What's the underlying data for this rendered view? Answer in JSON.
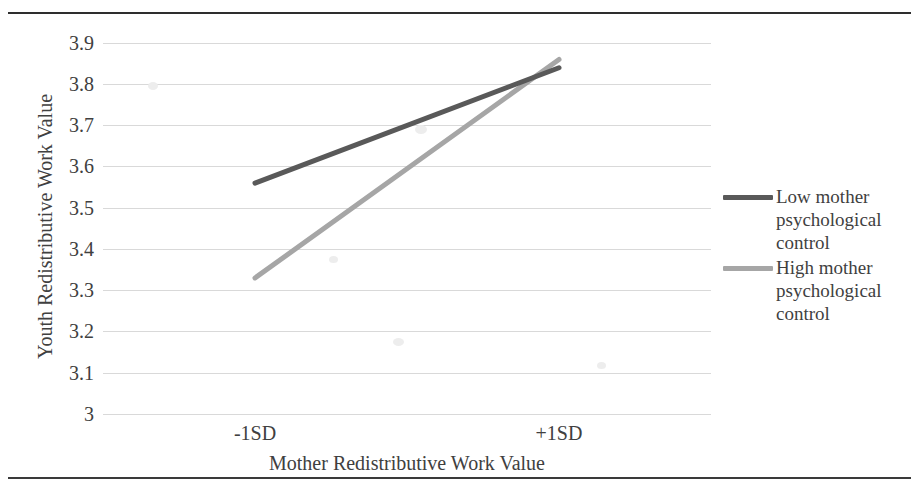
{
  "chart_data": {
    "type": "line",
    "title": "",
    "xlabel": "Mother Redistributive Work Value",
    "ylabel": "Youth Redistributive Work Value",
    "categories": [
      "-1SD",
      "+1SD"
    ],
    "x_tick_labels": [
      "-1SD",
      "+1SD"
    ],
    "y_tick_labels": [
      "3.9",
      "3.8",
      "3.7",
      "3.6",
      "3.5",
      "3.4",
      "3.3",
      "3.2",
      "3.1",
      "3"
    ],
    "y_tick_values": [
      3.9,
      3.8,
      3.7,
      3.6,
      3.5,
      3.4,
      3.3,
      3.2,
      3.1,
      3.0
    ],
    "ylim": [
      3.0,
      3.9
    ],
    "grid": "horizontal",
    "legend_position": "right",
    "series": [
      {
        "name": "Low mother psychological control",
        "label_lines": [
          "Low mother",
          "psychological",
          "control"
        ],
        "values": [
          3.56,
          3.84
        ],
        "color": "#595959"
      },
      {
        "name": "High mother psychological control",
        "label_lines": [
          "High mother",
          "psychological",
          "control"
        ],
        "values": [
          3.33,
          3.86
        ],
        "color": "#a6a6a6"
      }
    ]
  },
  "axes": {
    "y_title": "Youth Redistributive Work Value",
    "x_title": "Mother Redistributive Work Value",
    "y_ticks": [
      "3.9",
      "3.8",
      "3.7",
      "3.6",
      "3.5",
      "3.4",
      "3.3",
      "3.2",
      "3.1",
      "3"
    ],
    "x_ticks": [
      "-1SD",
      "+1SD"
    ]
  },
  "legend": {
    "entries": [
      {
        "line1": "Low mother",
        "line2": "psychological",
        "line3": "control",
        "color": "#595959"
      },
      {
        "line1": "High mother",
        "line2": "psychological",
        "line3": "control",
        "color": "#a6a6a6"
      }
    ]
  },
  "colors": {
    "dark_series": "#595959",
    "light_series": "#a6a6a6",
    "gridline": "#d9d9d9",
    "rule": "#2e2e2e",
    "text": "#404040"
  }
}
